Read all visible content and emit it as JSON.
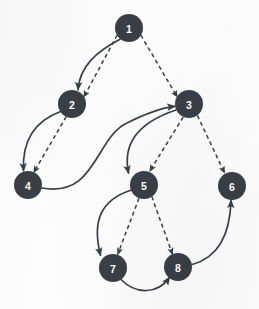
{
  "figure": {
    "kind": "directed-graph-diagram",
    "width": 259,
    "height": 309,
    "background_color": "#fdfdfd",
    "node_color": "#3a3f45",
    "node_label_color": "#ffffff",
    "edge_color": "#3a3f45",
    "node_radius": 14
  },
  "nodes": [
    {
      "id": "1",
      "label": "1",
      "x": 129,
      "y": 28
    },
    {
      "id": "2",
      "label": "2",
      "x": 72,
      "y": 104
    },
    {
      "id": "3",
      "label": "3",
      "x": 189,
      "y": 104
    },
    {
      "id": "4",
      "label": "4",
      "x": 28,
      "y": 185
    },
    {
      "id": "5",
      "label": "5",
      "x": 144,
      "y": 185
    },
    {
      "id": "6",
      "label": "6",
      "x": 232,
      "y": 186
    },
    {
      "id": "7",
      "label": "7",
      "x": 113,
      "y": 268
    },
    {
      "id": "8",
      "label": "8",
      "x": 178,
      "y": 267
    }
  ],
  "edges": [
    {
      "from": "1",
      "to": "2",
      "style": "solid",
      "path": "M 120.0 39.3 C 96 52 80 66 78 89.5"
    },
    {
      "from": "1",
      "to": "2",
      "style": "dashed",
      "path": "M 117.2 35.1 L 83.8 96.9"
    },
    {
      "from": "1",
      "to": "3",
      "style": "dashed",
      "path": "M 140.8 35.1 L 177.2 96.9"
    },
    {
      "from": "2",
      "to": "4",
      "style": "solid",
      "path": "M 60.5 111.5 C 35 121 22 140 23.5 170.6"
    },
    {
      "from": "2",
      "to": "4",
      "style": "dashed",
      "path": "M 66.2 116.6 L 33.8 172.4"
    },
    {
      "from": "4",
      "to": "3",
      "style": "solid",
      "path": "M 42.0 188.0 C 96 198 95 138 127 123 C 147 113 160 108 174.7 106.4"
    },
    {
      "from": "3",
      "to": "5",
      "style": "solid",
      "path": "M 176.0 110.0 C 140 122 122 142 128.5 173.0"
    },
    {
      "from": "3",
      "to": "5",
      "style": "dashed",
      "path": "M 183.2 117.1 L 149.8 171.0"
    },
    {
      "from": "3",
      "to": "6",
      "style": "dashed",
      "path": "M 197.4 115.5 L 224.5 172.8"
    },
    {
      "from": "5",
      "to": "7",
      "style": "solid",
      "path": "M 131.5 190.0 C 100 200 92 222 100.5 255.2"
    },
    {
      "from": "5",
      "to": "7",
      "style": "dashed",
      "path": "M 139.0 198.2 L 117.8 254.2"
    },
    {
      "from": "5",
      "to": "8",
      "style": "dashed",
      "path": "M 151.8 196.6 L 172.5 254.2"
    },
    {
      "from": "7",
      "to": "8",
      "style": "solid",
      "path": "M 121.0 279.5 C 136 295 158 294 169.5 277.5"
    },
    {
      "from": "8",
      "to": "6",
      "style": "solid",
      "path": "M 192.2 264.5 C 216 258 230 238 231.0 200.5"
    }
  ]
}
